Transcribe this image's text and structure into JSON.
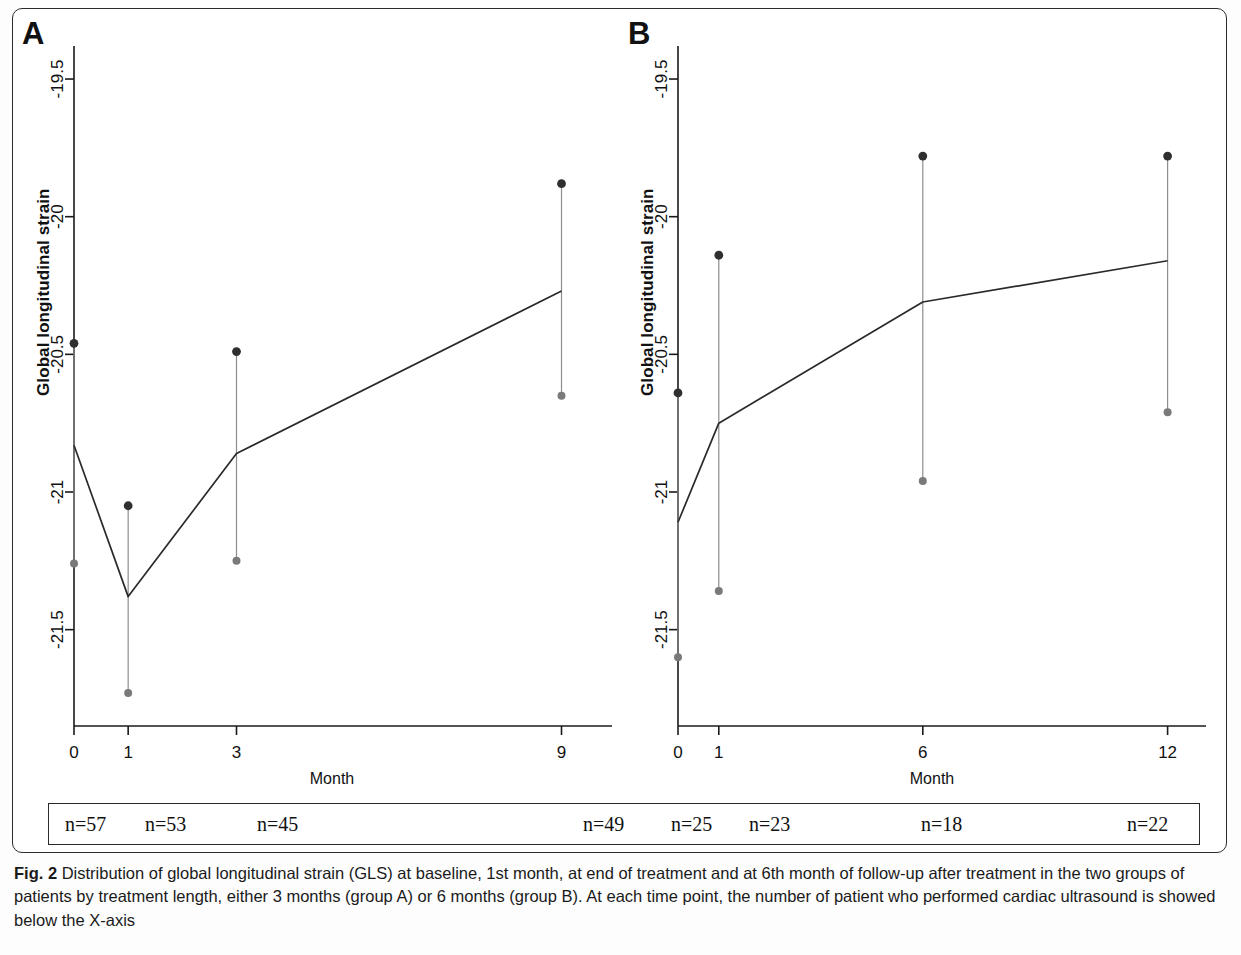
{
  "figure": {
    "caption_label": "Fig. 2",
    "caption_text": "Distribution of global longitudinal strain (GLS) at baseline, 1st month, at end of treatment and at 6th month of follow-up after treatment in the two groups of patients by treatment length, either 3 months (group A) or 6 months (group B). At each time point, the number of patient who performed cardiac ultrasound is showed below the X-axis"
  },
  "panels": {
    "a": {
      "letter": "A",
      "ylabel": "Global longitudinal strain",
      "xlabel": "Month",
      "counts": [
        "n=57",
        "n=53",
        "n=45",
        "n=49"
      ]
    },
    "b": {
      "letter": "B",
      "ylabel": "Global longitudinal strain",
      "xlabel": "Month",
      "counts": [
        "n=25",
        "n=23",
        "n=18",
        "n=22"
      ]
    }
  },
  "chart_data": [
    {
      "type": "line",
      "panel": "A",
      "title": "",
      "xlabel": "Month",
      "ylabel": "Global longitudinal strain",
      "x": [
        0,
        1,
        3,
        9
      ],
      "xtick_labels": [
        "0",
        "1",
        "3",
        "9"
      ],
      "xlim": [
        0,
        9.6
      ],
      "ytick_labels": [
        "-19.5",
        "-20",
        "-20.5",
        "-21",
        "-21.5"
      ],
      "yticks": [
        -19.5,
        -20,
        -20.5,
        -21,
        -21.5
      ],
      "ylim": [
        -21.85,
        -19.38
      ],
      "grid": false,
      "legend": "none",
      "series": [
        {
          "name": "Mean GLS (group A)",
          "values": [
            -20.83,
            -21.38,
            -20.86,
            -20.27
          ]
        },
        {
          "name": "Upper bound",
          "values": [
            -20.46,
            -21.05,
            -20.49,
            -19.88
          ]
        },
        {
          "name": "Lower bound",
          "values": [
            -21.26,
            -21.73,
            -21.25,
            -20.65
          ]
        }
      ]
    },
    {
      "type": "line",
      "panel": "B",
      "title": "",
      "xlabel": "Month",
      "ylabel": "Global longitudinal strain",
      "x": [
        0,
        1,
        6,
        12
      ],
      "xtick_labels": [
        "0",
        "1",
        "6",
        "12"
      ],
      "xlim": [
        0,
        12.5
      ],
      "ytick_labels": [
        "-19.5",
        "-20",
        "-20.5",
        "-21",
        "-21.5"
      ],
      "yticks": [
        -19.5,
        -20,
        -20.5,
        -21,
        -21.5
      ],
      "ylim": [
        -21.85,
        -19.38
      ],
      "grid": false,
      "legend": "none",
      "series": [
        {
          "name": "Mean GLS (group B)",
          "values": [
            -21.11,
            -20.75,
            -20.31,
            -20.16
          ]
        },
        {
          "name": "Upper bound",
          "values": [
            -20.64,
            -20.14,
            -19.78,
            -19.78
          ]
        },
        {
          "name": "Lower bound",
          "values": [
            -21.6,
            -21.36,
            -20.96,
            -20.71
          ]
        }
      ]
    }
  ]
}
